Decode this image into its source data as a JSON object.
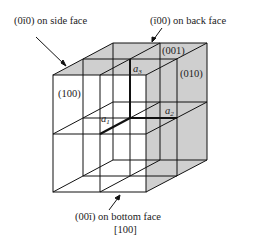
{
  "figure": {
    "caption": "[100]",
    "labels": {
      "side_face": "(0ī0) on side face",
      "back_face": "(ī00) on back face",
      "bottom_face": "(00ī) on bottom face",
      "face_100": "(100)",
      "face_001": "(001)",
      "face_010": "(010)",
      "a1": "a",
      "a1_sub": "1",
      "a2": "a",
      "a2_sub": "2",
      "a3": "a",
      "a3_sub": "3"
    },
    "colors": {
      "shade": "#cfcfcf",
      "line": "#111111",
      "text": "#222222"
    }
  }
}
